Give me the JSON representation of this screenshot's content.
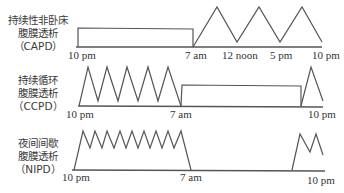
{
  "rows": [
    {
      "id": "capd",
      "label_lines": [
        "持续性非卧床",
        "腹膜透析",
        "（CAPD）"
      ],
      "ticks": [
        "10 pm",
        "7 am",
        "12 noon",
        "5 pm",
        "10 pm"
      ]
    },
    {
      "id": "ccpd",
      "label_lines": [
        "持续循环",
        "腹膜透析",
        "（CCPD）"
      ],
      "ticks": [
        "10 pm",
        "7 am",
        "10 pm"
      ]
    },
    {
      "id": "nipd",
      "label_lines": [
        "夜间间歇",
        "腹膜透析",
        "（NIPD）"
      ],
      "ticks": [
        "10 pm",
        "7 am",
        "10 pm"
      ]
    }
  ],
  "colors": {
    "line": "#555555",
    "text": "#333333",
    "background": "#ffffff"
  }
}
